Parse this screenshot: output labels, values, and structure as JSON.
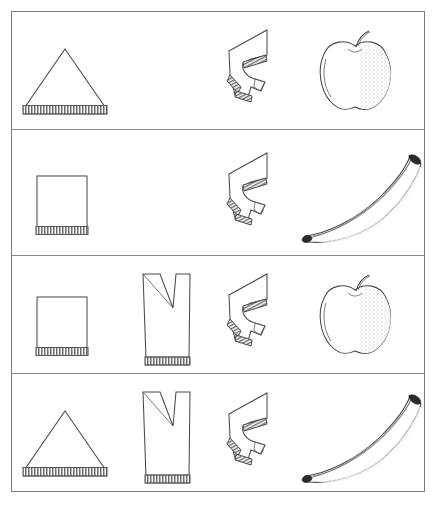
{
  "figure": {
    "frame": {
      "x": 11,
      "y": 11,
      "width": 414,
      "height": 481,
      "border_color": "#7a7a7a"
    },
    "background_color": "#ffffff",
    "ink_color": "#4a4a4a",
    "row_divider_color": "#8a8a8a",
    "columns": [
      {
        "key": "col1",
        "name": "base-shape-column",
        "x": 0,
        "width": 105
      },
      {
        "key": "col2",
        "name": "notched-shape-column",
        "x": 105,
        "width": 95
      },
      {
        "key": "col3",
        "name": "zigzag-shape-column",
        "x": 196,
        "width": 92
      },
      {
        "key": "col4",
        "name": "fruit-column",
        "x": 282,
        "width": 132
      }
    ],
    "rows": [
      {
        "index": 1,
        "name": "row-1",
        "y": 0,
        "height": 118,
        "items": [
          {
            "column": "col1",
            "shape": "triangle",
            "label": "triangle-with-hatched-base",
            "present": true
          },
          {
            "column": "col2",
            "shape": "none",
            "label": "empty-cell",
            "present": false
          },
          {
            "column": "col3",
            "shape": "zigzag",
            "label": "zigzag-polygon",
            "present": true
          },
          {
            "column": "col4",
            "shape": "apple",
            "label": "apple",
            "present": true
          }
        ]
      },
      {
        "index": 2,
        "name": "row-2",
        "y": 118,
        "height": 126,
        "items": [
          {
            "column": "col1",
            "shape": "square",
            "label": "square-with-hatched-base",
            "present": true
          },
          {
            "column": "col2",
            "shape": "none",
            "label": "empty-cell",
            "present": false
          },
          {
            "column": "col3",
            "shape": "zigzag",
            "label": "zigzag-polygon",
            "present": true
          },
          {
            "column": "col4",
            "shape": "banana",
            "label": "banana",
            "present": true
          }
        ]
      },
      {
        "index": 3,
        "name": "row-3",
        "y": 244,
        "height": 118,
        "items": [
          {
            "column": "col1",
            "shape": "square",
            "label": "square-with-hatched-base",
            "present": true
          },
          {
            "column": "col2",
            "shape": "vnotch",
            "label": "notched-cup-shape",
            "present": true
          },
          {
            "column": "col3",
            "shape": "zigzag",
            "label": "zigzag-polygon",
            "present": true
          },
          {
            "column": "col4",
            "shape": "apple",
            "label": "apple",
            "present": true
          }
        ]
      },
      {
        "index": 4,
        "name": "row-4",
        "y": 362,
        "height": 119,
        "items": [
          {
            "column": "col1",
            "shape": "triangle",
            "label": "triangle-with-hatched-base",
            "present": true
          },
          {
            "column": "col2",
            "shape": "vnotch",
            "label": "notched-cup-shape",
            "present": true
          },
          {
            "column": "col3",
            "shape": "zigzag",
            "label": "zigzag-polygon",
            "present": true
          },
          {
            "column": "col4",
            "shape": "banana",
            "label": "banana",
            "present": true
          }
        ]
      }
    ]
  }
}
